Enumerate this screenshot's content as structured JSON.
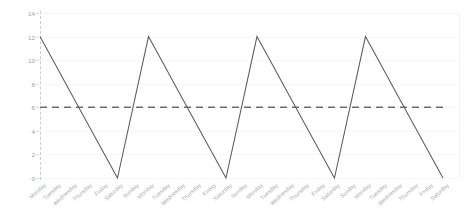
{
  "chart_data": {
    "type": "line",
    "title": "",
    "subtitle": "",
    "xlabel": "",
    "ylabel": "",
    "ylim": [
      0,
      14
    ],
    "yticks": [
      0,
      2,
      4,
      6,
      8,
      10,
      12,
      14
    ],
    "grid": true,
    "legend": "none",
    "x": [
      "Monday",
      "Tuesday",
      "Wednesday",
      "Thursday",
      "Friday",
      "Saturday",
      "Sunday",
      "Monday",
      "Tuesday",
      "Wednesday",
      "Thursday",
      "Friday",
      "Saturday",
      "Sunday",
      "Monday",
      "Tuesday",
      "Wednesday",
      "Thursday",
      "Friday",
      "Saturday",
      "Sunday",
      "Monday",
      "Tuesday",
      "Wednesday",
      "Thursday",
      "Friday",
      "Saturday"
    ],
    "series": [
      {
        "name": "value",
        "style": "solid",
        "color": "#585b60",
        "values": [
          12,
          9.6,
          7.2,
          4.8,
          2.4,
          0,
          6,
          12,
          9.6,
          7.2,
          4.8,
          2.4,
          0,
          6,
          12,
          9.6,
          7.2,
          4.8,
          2.4,
          0,
          6,
          12,
          9.6,
          7.2,
          4.8,
          2.4,
          0
        ]
      },
      {
        "name": "threshold",
        "style": "dashed",
        "color": "#6b6f75",
        "constant": 6
      }
    ],
    "annotations": []
  },
  "axes": {
    "y_tick_labels": [
      "0",
      "2",
      "4",
      "6",
      "8",
      "10",
      "12",
      "14"
    ],
    "x_tick_labels": [
      "Monday",
      "Tuesday",
      "Wednesday",
      "Thursday",
      "Friday",
      "Saturday",
      "Sunday",
      "Monday",
      "Tuesday",
      "Wednesday",
      "Thursday",
      "Friday",
      "Saturday",
      "Sunday",
      "Monday",
      "Tuesday",
      "Wednesday",
      "Thursday",
      "Friday",
      "Saturday",
      "Sunday",
      "Monday",
      "Tuesday",
      "Wednesday",
      "Thursday",
      "Friday",
      "Saturday"
    ]
  },
  "colors": {
    "series_line": "#585b60",
    "threshold_line": "#6b6f75",
    "gridline": "#f5f6f8",
    "axis": "#c9ccd2",
    "tick_text": "#9aa0a6",
    "background": "#ffffff"
  }
}
